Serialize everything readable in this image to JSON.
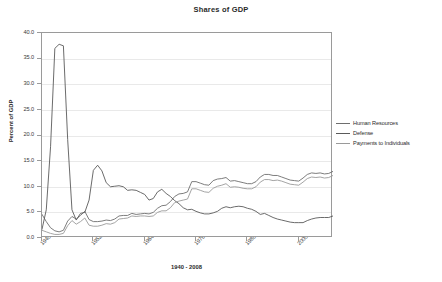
{
  "chart_data": {
    "type": "line",
    "title": "Shares of GDP",
    "xlabel": "1940 - 2008",
    "ylabel": "Percent of GDP",
    "xlim": [
      1940,
      2008
    ],
    "ylim": [
      0.0,
      40.0
    ],
    "ytick_labels": [
      "40.0",
      "35.0",
      "30.0",
      "25.0",
      "20.0",
      "15.0",
      "10.0",
      "5.0",
      "0.0"
    ],
    "ytick_values": [
      40.0,
      35.0,
      30.0,
      25.0,
      20.0,
      15.0,
      10.0,
      5.0,
      0.0
    ],
    "xtick_labels": [
      "1940",
      "1952",
      "1964",
      "1976",
      "1988",
      "2000"
    ],
    "xtick_values": [
      1940,
      1952,
      1964,
      1976,
      1988,
      2000
    ],
    "grid": "horizontal",
    "legend_position": "right",
    "x": [
      1940,
      1941,
      1942,
      1943,
      1944,
      1945,
      1946,
      1947,
      1948,
      1949,
      1950,
      1951,
      1952,
      1953,
      1954,
      1955,
      1956,
      1957,
      1958,
      1959,
      1960,
      1961,
      1962,
      1963,
      1964,
      1965,
      1966,
      1967,
      1968,
      1969,
      1970,
      1971,
      1972,
      1973,
      1974,
      1975,
      1976,
      1977,
      1978,
      1979,
      1980,
      1981,
      1982,
      1983,
      1984,
      1985,
      1986,
      1987,
      1988,
      1989,
      1990,
      1991,
      1992,
      1993,
      1994,
      1995,
      1996,
      1997,
      1998,
      1999,
      2000,
      2001,
      2002,
      2003,
      2004,
      2005,
      2006,
      2007,
      2008
    ],
    "series": [
      {
        "name": "Human Resources",
        "color": "#6e6e6e",
        "values": [
          4.6,
          3.2,
          2.0,
          1.4,
          1.2,
          1.5,
          3.3,
          4.2,
          3.7,
          4.4,
          5.2,
          3.6,
          3.2,
          3.2,
          3.3,
          3.5,
          3.4,
          3.7,
          4.3,
          4.4,
          4.4,
          4.8,
          4.6,
          4.7,
          4.8,
          4.7,
          5.0,
          5.8,
          6.3,
          6.4,
          7.1,
          8.1,
          8.6,
          8.7,
          9.0,
          11.0,
          11.0,
          10.7,
          10.4,
          10.3,
          11.2,
          11.5,
          11.6,
          11.8,
          11.1,
          11.2,
          11.0,
          10.8,
          10.6,
          10.6,
          11.0,
          11.9,
          12.4,
          12.4,
          12.2,
          12.2,
          11.9,
          11.6,
          11.3,
          11.2,
          11.1,
          11.7,
          12.4,
          12.7,
          12.6,
          12.7,
          12.5,
          12.6,
          13.0
        ]
      },
      {
        "name": "Defense",
        "color": "#5a5a5a",
        "values": [
          1.7,
          5.5,
          17.8,
          37.0,
          37.8,
          37.5,
          19.2,
          5.5,
          3.5,
          4.8,
          5.0,
          7.4,
          13.2,
          14.2,
          13.1,
          10.8,
          10.0,
          10.1,
          10.2,
          10.0,
          9.3,
          9.4,
          9.3,
          8.9,
          8.5,
          7.4,
          7.7,
          9.0,
          9.5,
          8.7,
          8.1,
          7.3,
          6.7,
          5.9,
          5.5,
          5.6,
          5.2,
          4.9,
          4.7,
          4.7,
          4.9,
          5.2,
          5.8,
          6.1,
          5.9,
          6.1,
          6.2,
          6.1,
          5.8,
          5.6,
          5.2,
          4.6,
          4.8,
          4.4,
          4.0,
          3.7,
          3.5,
          3.3,
          3.1,
          3.0,
          3.0,
          3.0,
          3.4,
          3.7,
          3.9,
          4.0,
          4.0,
          4.0,
          4.3
        ]
      },
      {
        "name": "Payments to Individuals",
        "color": "#9a9a9a",
        "values": [
          1.5,
          1.2,
          0.9,
          0.7,
          0.7,
          0.9,
          2.4,
          3.4,
          2.7,
          3.2,
          3.9,
          2.5,
          2.3,
          2.3,
          2.5,
          2.8,
          2.7,
          3.0,
          3.7,
          3.8,
          3.9,
          4.3,
          4.2,
          4.3,
          4.3,
          4.2,
          4.3,
          5.0,
          5.3,
          5.3,
          5.9,
          6.9,
          7.2,
          7.4,
          7.6,
          9.6,
          9.6,
          9.3,
          9.0,
          8.9,
          9.7,
          10.1,
          10.3,
          10.6,
          9.9,
          10.0,
          9.9,
          9.7,
          9.6,
          9.6,
          10.0,
          10.9,
          11.4,
          11.4,
          11.2,
          11.3,
          11.1,
          10.8,
          10.5,
          10.4,
          10.3,
          10.9,
          11.6,
          11.9,
          11.8,
          11.9,
          11.7,
          11.8,
          12.2
        ]
      }
    ]
  }
}
